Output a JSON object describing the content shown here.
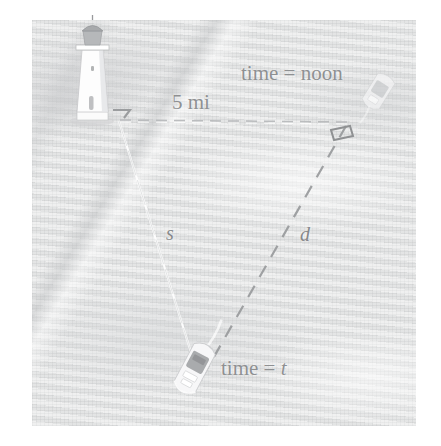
{
  "figure": {
    "kind": "photograph-with-diagram-overlay",
    "scene": "aerial photo of a lighthouse on shore and a ship at sea, with a related-rates triangle drawn over it",
    "background_color": "#e9eaea",
    "plate_border_color": "#ffffff",
    "annotation_color": "#8e9092",
    "line_color_solid": "#ffffff",
    "line_color_dashed": "#9a9c9e"
  },
  "labels": {
    "time_noon": "time = noon",
    "distance_5mi": "5 mi",
    "time_t": "time = t",
    "segment_s": "s",
    "segment_d": "d"
  },
  "objects": {
    "lighthouse": "lighthouse",
    "ship_noon": "ship-at-noon",
    "ship_time_t": "ship-at-time-t"
  },
  "geometry": {
    "vertex_lighthouse": [
      119,
      119
    ],
    "vertex_noon": [
      348,
      122
    ],
    "vertex_ship_t": [
      200,
      377
    ],
    "right_angle_at": "noon",
    "angle_mark_at_lighthouse": true,
    "horizontal_segment": "5 mi",
    "solid_segment": "s",
    "dashed_segment": "d"
  },
  "chart_data": {
    "type": "diagram",
    "title": "",
    "annotations": [
      {
        "text": "time = noon",
        "x": 241,
        "y": 63
      },
      {
        "text": "5 mi",
        "x": 172,
        "y": 92
      },
      {
        "text": "s",
        "x": 166,
        "y": 223,
        "style": "italic"
      },
      {
        "text": "d",
        "x": 300,
        "y": 224,
        "style": "italic"
      },
      {
        "text": "time = t",
        "x": 221,
        "y": 358
      }
    ],
    "segments": [
      {
        "label": "5 mi",
        "from": "lighthouse",
        "to": "ship-at-noon",
        "style": "dashed-light",
        "length_value": 5,
        "length_unit": "mi"
      },
      {
        "label": "s",
        "from": "lighthouse",
        "to": "ship-at-time-t",
        "style": "solid-white"
      },
      {
        "label": "d",
        "from": "ship-at-noon",
        "to": "ship-at-time-t",
        "style": "dashed-grey"
      }
    ]
  }
}
